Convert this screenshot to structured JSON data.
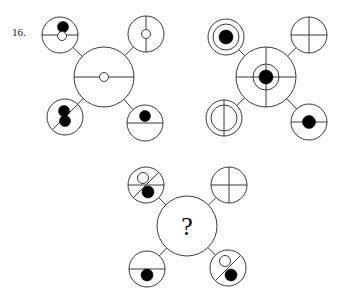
{
  "problem": {
    "number_label": "16.",
    "question_mark": "?",
    "stroke_color": "#3a3a3a",
    "fill_color": "#000000",
    "background_color": "#ffffff"
  },
  "figures": [
    {
      "id": "figure-1",
      "name": "first-analogy-figure",
      "center": {
        "name": "center-circle",
        "cx": 104,
        "cy": 77,
        "r": 30,
        "rings": [],
        "lines": [
          "horizontal"
        ],
        "dots": [
          {
            "type": "open",
            "cx": 104,
            "cy": 77,
            "r": 4.5
          }
        ]
      },
      "satellites": [
        {
          "name": "satellite-top-left",
          "cx": 60,
          "cy": 35,
          "r": 18,
          "rings": [],
          "lines": [
            "horizontal"
          ],
          "dots": [
            {
              "type": "filled",
              "cx": 63,
              "cy": 27,
              "r": 5.5
            },
            {
              "type": "open",
              "cx": 62,
              "cy": 36,
              "r": 4.5
            }
          ]
        },
        {
          "name": "satellite-top-right",
          "cx": 146,
          "cy": 34,
          "r": 18,
          "rings": [],
          "lines": [
            "vertical"
          ],
          "dots": [
            {
              "type": "open",
              "cx": 146,
              "cy": 34,
              "r": 4.5
            }
          ]
        },
        {
          "name": "satellite-bottom-left",
          "cx": 65,
          "cy": 117,
          "r": 18,
          "rings": [],
          "lines": [
            "diagonal-ne-sw"
          ],
          "dots": [
            {
              "type": "filled",
              "cx": 64,
              "cy": 111,
              "r": 5.5
            },
            {
              "type": "filled",
              "cx": 65,
              "cy": 121,
              "r": 5.5
            }
          ]
        },
        {
          "name": "satellite-bottom-right",
          "cx": 145,
          "cy": 123,
          "r": 18,
          "rings": [],
          "lines": [
            "horizontal"
          ],
          "dots": [
            {
              "type": "filled",
              "cx": 145,
              "cy": 116,
              "r": 5.5
            }
          ]
        }
      ]
    },
    {
      "id": "figure-2",
      "name": "second-analogy-figure",
      "center": {
        "name": "center-circle",
        "cx": 266,
        "cy": 77,
        "r": 30,
        "rings": [
          13
        ],
        "lines": [
          "horizontal",
          "vertical"
        ],
        "dots": [
          {
            "type": "filled",
            "cx": 266,
            "cy": 77,
            "r": 7
          }
        ]
      },
      "satellites": [
        {
          "name": "satellite-top-left",
          "cx": 226,
          "cy": 37,
          "r": 18,
          "rings": [
            13
          ],
          "lines": [],
          "dots": [
            {
              "type": "filled",
              "cx": 226,
              "cy": 37,
              "r": 7
            }
          ]
        },
        {
          "name": "satellite-top-right",
          "cx": 309,
          "cy": 35,
          "r": 18,
          "rings": [],
          "lines": [
            "horizontal",
            "vertical"
          ],
          "dots": []
        },
        {
          "name": "satellite-bottom-left",
          "cx": 224,
          "cy": 118,
          "r": 18,
          "rings": [
            13
          ],
          "lines": [
            "vertical"
          ],
          "dots": []
        },
        {
          "name": "satellite-bottom-right",
          "cx": 309,
          "cy": 122,
          "r": 18,
          "rings": [],
          "lines": [
            "horizontal"
          ],
          "dots": [
            {
              "type": "filled",
              "cx": 309,
              "cy": 122,
              "r": 6.5
            }
          ]
        }
      ]
    },
    {
      "id": "figure-3",
      "name": "answer-figure-with-unknown",
      "center": {
        "name": "center-circle-unknown",
        "cx": 187,
        "cy": 226,
        "r": 30,
        "rings": [],
        "lines": [],
        "dots": [],
        "question_mark": true
      },
      "satellites": [
        {
          "name": "satellite-top-left",
          "cx": 146,
          "cy": 185,
          "r": 18,
          "rings": [],
          "lines": [
            "horizontal",
            "diagonal-ne-sw"
          ],
          "dots": [
            {
              "type": "open",
              "cx": 143,
              "cy": 178,
              "r": 5.5
            },
            {
              "type": "filled",
              "cx": 148,
              "cy": 192,
              "r": 6
            }
          ]
        },
        {
          "name": "satellite-top-right",
          "cx": 229,
          "cy": 185,
          "r": 18,
          "rings": [],
          "lines": [
            "horizontal",
            "vertical"
          ],
          "dots": []
        },
        {
          "name": "satellite-bottom-left",
          "cx": 147,
          "cy": 269,
          "r": 18,
          "rings": [],
          "lines": [
            "horizontal"
          ],
          "dots": [
            {
              "type": "filled",
              "cx": 147,
              "cy": 275,
              "r": 6
            }
          ]
        },
        {
          "name": "satellite-bottom-right",
          "cx": 228,
          "cy": 268,
          "r": 18,
          "rings": [],
          "lines": [
            "diagonal-ne-sw"
          ],
          "dots": [
            {
              "type": "open",
              "cx": 225,
              "cy": 261,
              "r": 5.5
            },
            {
              "type": "filled",
              "cx": 231,
              "cy": 275,
              "r": 6
            }
          ]
        }
      ]
    }
  ]
}
